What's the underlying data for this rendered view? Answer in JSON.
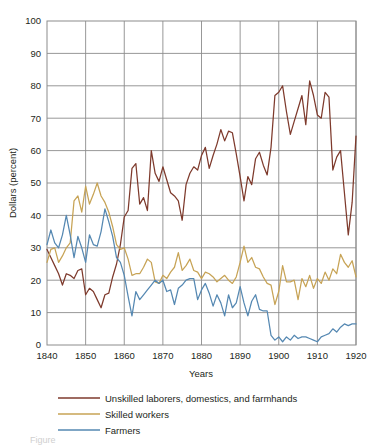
{
  "chart_data": {
    "type": "line",
    "title": "",
    "xlabel": "Years",
    "ylabel": "Dollars (percent)",
    "xlim": [
      1840,
      1920
    ],
    "ylim": [
      0,
      100
    ],
    "xticks": [
      1840,
      1850,
      1860,
      1870,
      1880,
      1890,
      1900,
      1910,
      1920
    ],
    "yticks": [
      0,
      10,
      20,
      30,
      40,
      50,
      60,
      70,
      80,
      90,
      100
    ],
    "grid": true,
    "legend_position": "bottom",
    "x": [
      1840,
      1841,
      1842,
      1843,
      1844,
      1845,
      1846,
      1847,
      1848,
      1849,
      1850,
      1851,
      1852,
      1853,
      1854,
      1855,
      1856,
      1857,
      1858,
      1859,
      1860,
      1861,
      1862,
      1863,
      1864,
      1865,
      1866,
      1867,
      1868,
      1869,
      1870,
      1871,
      1872,
      1873,
      1874,
      1875,
      1876,
      1877,
      1878,
      1879,
      1880,
      1881,
      1882,
      1883,
      1884,
      1885,
      1886,
      1887,
      1888,
      1889,
      1890,
      1891,
      1892,
      1893,
      1894,
      1895,
      1896,
      1897,
      1898,
      1899,
      1900,
      1901,
      1902,
      1903,
      1904,
      1905,
      1906,
      1907,
      1908,
      1909,
      1910,
      1911,
      1912,
      1913,
      1914,
      1915,
      1916,
      1917,
      1918,
      1919,
      1920
    ],
    "series": [
      {
        "name": "Unskilled laborers, domestics, and farmhands",
        "color": "#7E3A2C",
        "values": [
          29.5,
          27.0,
          24.5,
          22.0,
          18.5,
          22.0,
          21.5,
          20.5,
          23.0,
          23.5,
          15.5,
          17.5,
          16.5,
          14.0,
          11.5,
          15.5,
          16.0,
          21.0,
          25.0,
          31.0,
          39.5,
          41.5,
          54.5,
          56.0,
          43.5,
          45.5,
          41.5,
          60.0,
          53.0,
          50.5,
          55.0,
          51.0,
          47.0,
          46.0,
          44.5,
          38.5,
          49.5,
          53.0,
          55.0,
          54.0,
          58.5,
          61.0,
          54.5,
          58.5,
          62.0,
          66.5,
          63.0,
          66.0,
          65.5,
          59.0,
          52.0,
          44.5,
          52.0,
          49.5,
          57.5,
          59.5,
          55.5,
          52.5,
          61.0,
          77.0,
          78.0,
          80.0,
          72.0,
          65.0,
          69.0,
          73.0,
          77.0,
          68.0,
          81.5,
          77.0,
          71.0,
          70.0,
          78.0,
          76.5,
          54.0,
          58.0,
          60.0,
          47.0,
          34.0,
          44.0,
          64.5
        ]
      },
      {
        "name": "Skilled workers",
        "color": "#C7A355",
        "values": [
          25.5,
          29.5,
          30.0,
          25.5,
          27.5,
          30.0,
          31.5,
          44.5,
          46.0,
          41.0,
          49.0,
          43.5,
          46.5,
          50.0,
          46.0,
          44.0,
          41.0,
          36.5,
          31.0,
          29.5,
          30.0,
          26.5,
          21.5,
          22.0,
          22.0,
          24.0,
          26.5,
          25.5,
          19.5,
          19.0,
          21.5,
          20.5,
          22.5,
          24.0,
          28.5,
          23.0,
          24.5,
          26.5,
          23.0,
          22.5,
          20.5,
          22.5,
          22.0,
          21.0,
          19.5,
          20.5,
          21.5,
          20.0,
          19.0,
          21.0,
          25.5,
          30.5,
          25.5,
          27.0,
          24.0,
          23.5,
          21.0,
          19.0,
          18.5,
          12.5,
          16.5,
          24.5,
          19.5,
          19.5,
          20.0,
          14.0,
          20.5,
          18.0,
          21.5,
          17.5,
          20.5,
          19.0,
          22.5,
          20.0,
          23.5,
          22.0,
          28.0,
          25.5,
          24.0,
          26.0,
          21.0
        ]
      },
      {
        "name": "Farmers",
        "color": "#5588B2",
        "values": [
          31.0,
          35.5,
          31.5,
          30.0,
          34.0,
          40.0,
          34.0,
          27.0,
          33.5,
          30.0,
          25.5,
          34.0,
          31.0,
          30.5,
          35.0,
          42.0,
          38.0,
          33.5,
          27.0,
          25.5,
          21.5,
          15.0,
          9.0,
          16.5,
          14.0,
          15.5,
          17.0,
          18.5,
          20.0,
          19.0,
          20.0,
          16.5,
          17.0,
          12.5,
          17.5,
          18.5,
          20.0,
          20.5,
          20.5,
          14.0,
          17.0,
          19.0,
          16.0,
          12.0,
          15.5,
          13.0,
          9.0,
          15.5,
          11.5,
          13.0,
          18.0,
          13.0,
          9.0,
          13.5,
          15.5,
          11.0,
          10.5,
          10.5,
          3.0,
          1.5,
          2.5,
          1.0,
          2.5,
          1.5,
          3.0,
          2.0,
          2.5,
          2.5,
          2.0,
          1.5,
          1.0,
          2.5,
          3.0,
          3.5,
          5.0,
          4.0,
          5.5,
          6.5,
          6.0,
          6.5,
          6.5
        ]
      }
    ]
  },
  "legend": {
    "items": [
      {
        "label": "Unskilled laborers, domestics, and farmhands",
        "color": "#7E3A2C"
      },
      {
        "label": "Skilled workers",
        "color": "#C7A355"
      },
      {
        "label": "Farmers",
        "color": "#5588B2"
      }
    ]
  },
  "caption": {
    "text": "Figure"
  }
}
